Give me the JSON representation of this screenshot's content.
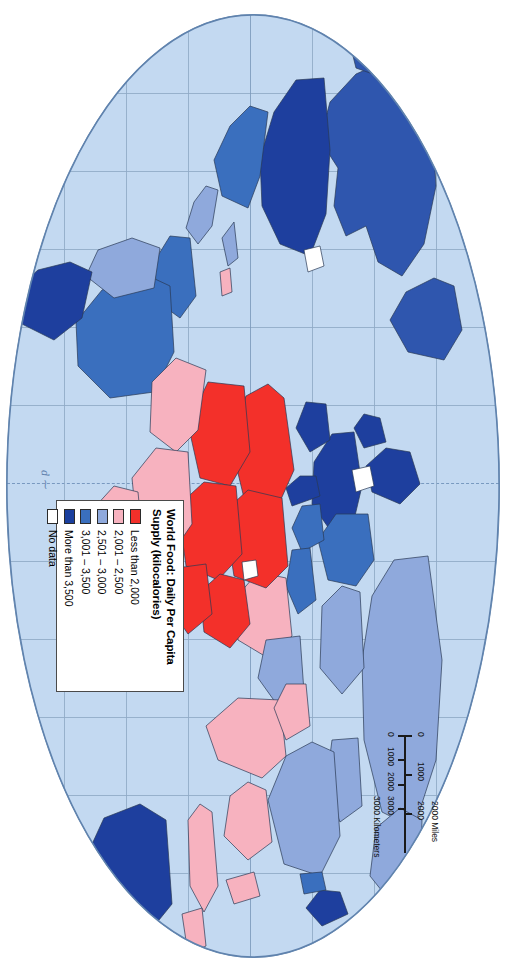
{
  "map": {
    "projection_note": "oval world projection",
    "ocean_color": "#c3d9f1",
    "graticule_color": "#8fa9c6",
    "outline_color": "#6f8fb4",
    "border_color": "#3c3c3c"
  },
  "legend": {
    "title": "World Food: Daily Per Capita Supply (kilocalories)",
    "title_line1": "World Food: Daily Per Capita",
    "title_line2": "Supply (kilocalories)",
    "classes": [
      {
        "label": "Less than 2,000",
        "color": "#f3302a"
      },
      {
        "label": "2,001 – 2,500",
        "color": "#f7b2bf"
      },
      {
        "label": "2,501 – 3,000",
        "color": "#8fa9dc"
      },
      {
        "label": "3,001 – 3,500",
        "color": "#3a6fbe"
      },
      {
        "label": "More than 3,500",
        "color": "#1a3f9e"
      },
      {
        "label": "No data",
        "color": "#ffffff"
      }
    ]
  },
  "scalebar": {
    "miles_unit": "2000 Miles",
    "km_unit": "3000 Kilometers",
    "miles_ticks": [
      "0",
      "1000",
      "2000"
    ],
    "km_ticks": [
      "0",
      "1000",
      "2000",
      "3000"
    ]
  },
  "signature": {
    "text": "d ⁓"
  }
}
